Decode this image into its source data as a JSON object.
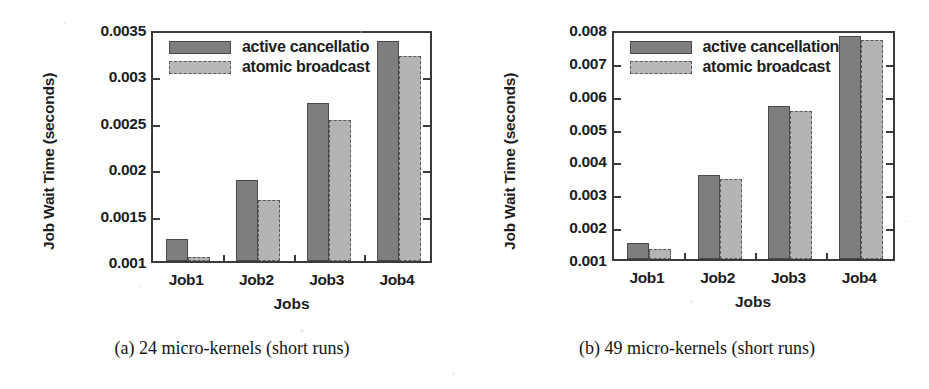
{
  "figure": {
    "panels": [
      {
        "id": "panel-a",
        "caption": "(a) 24 micro-kernels (short runs)",
        "legend": [
          {
            "label": "active cancellatio",
            "style": "dark"
          },
          {
            "label": "atomic broadcast",
            "style": "light"
          }
        ],
        "chart_data": {
          "type": "bar",
          "title": "",
          "subtitle": "",
          "xlabel": "Jobs",
          "ylabel": "Job Wait Time (seconds)",
          "categories": [
            "Job1",
            "Job2",
            "Job3",
            "Job4"
          ],
          "ylim": [
            0.001,
            0.0035
          ],
          "ytick_labels": [
            "0.001",
            "0.0015",
            "0.002",
            "0.0025",
            "0.003",
            "0.0035"
          ],
          "yticks": [
            0.001,
            0.0015,
            0.002,
            0.0025,
            0.003,
            0.0035
          ],
          "grid": false,
          "legend_position": "top-left-inside",
          "series": [
            {
              "name": "active cancellatio",
              "color": "#7e7e7e",
              "values": [
                0.00124,
                0.00187,
                0.0027,
                0.00337
              ]
            },
            {
              "name": "atomic broadcast",
              "color": "#b4b4b4",
              "values": [
                0.00104,
                0.00166,
                0.00252,
                0.00321
              ]
            }
          ]
        }
      },
      {
        "id": "panel-b",
        "caption": "(b) 49 micro-kernels (short runs)",
        "legend": [
          {
            "label": "active cancellation",
            "style": "dark"
          },
          {
            "label": "atomic broadcast",
            "style": "light"
          }
        ],
        "chart_data": {
          "type": "bar",
          "title": "",
          "subtitle": "",
          "xlabel": "Jobs",
          "ylabel": "Job Wait Time (seconds)",
          "categories": [
            "Job1",
            "Job2",
            "Job3",
            "Job4"
          ],
          "ylim": [
            0.001,
            0.008
          ],
          "ytick_labels": [
            "0.001",
            "0.002",
            "0.003",
            "0.004",
            "0.005",
            "0.006",
            "0.007",
            "0.008"
          ],
          "yticks": [
            0.001,
            0.002,
            0.003,
            0.004,
            0.005,
            0.006,
            0.007,
            0.008
          ],
          "grid": false,
          "legend_position": "top-left-inside",
          "series": [
            {
              "name": "active cancellation",
              "color": "#7e7e7e",
              "values": [
                0.00148,
                0.00355,
                0.00565,
                0.00778
              ]
            },
            {
              "name": "atomic broadcast",
              "color": "#b4b4b4",
              "values": [
                0.00132,
                0.00345,
                0.0055,
                0.00768
              ]
            }
          ]
        }
      }
    ]
  }
}
